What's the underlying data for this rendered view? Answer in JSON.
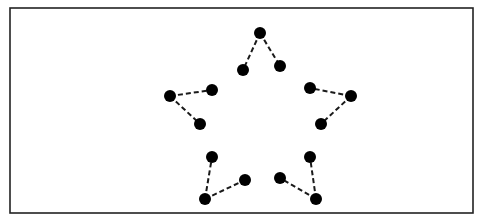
{
  "diagram": {
    "frame": {
      "x": 10,
      "y": 8,
      "width": 463,
      "height": 205,
      "stroke": "#222222"
    },
    "dot_color": "#000000",
    "line_color": "#1a1a1a",
    "dot_radius": 6,
    "groups": [
      {
        "name": "top-tip",
        "tip": {
          "x": 260,
          "y": 33
        },
        "inner": [
          {
            "x": 243,
            "y": 70
          },
          {
            "x": 280,
            "y": 66
          }
        ]
      },
      {
        "name": "left-tip",
        "tip": {
          "x": 170,
          "y": 96
        },
        "inner": [
          {
            "x": 212,
            "y": 90
          },
          {
            "x": 200,
            "y": 124
          }
        ]
      },
      {
        "name": "right-tip",
        "tip": {
          "x": 351,
          "y": 96
        },
        "inner": [
          {
            "x": 310,
            "y": 88
          },
          {
            "x": 321,
            "y": 124
          }
        ]
      },
      {
        "name": "bottom-left-tip",
        "tip": {
          "x": 205,
          "y": 199
        },
        "inner": [
          {
            "x": 212,
            "y": 157
          },
          {
            "x": 245,
            "y": 180
          }
        ]
      },
      {
        "name": "bottom-right-tip",
        "tip": {
          "x": 316,
          "y": 199
        },
        "inner": [
          {
            "x": 310,
            "y": 157
          },
          {
            "x": 280,
            "y": 178
          }
        ]
      }
    ]
  }
}
